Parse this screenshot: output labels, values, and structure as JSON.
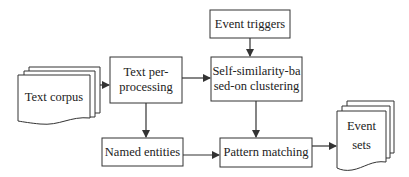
{
  "diagram": {
    "nodes": {
      "text_corpus": {
        "label": "Text corpus",
        "shape": "multi-document"
      },
      "text_preprocessing": {
        "line1": "Text per-",
        "line2": "processing",
        "shape": "rectangle"
      },
      "event_triggers": {
        "label": "Event triggers",
        "shape": "rectangle"
      },
      "self_similarity": {
        "line1": "Self-similarity-ba",
        "line2": "sed-on clustering",
        "shape": "rectangle"
      },
      "named_entities": {
        "label": "Named entities",
        "shape": "rectangle"
      },
      "pattern_matching": {
        "label": "Pattern matching",
        "shape": "rectangle"
      },
      "event_sets": {
        "line1": "Event",
        "line2": "sets",
        "shape": "multi-document"
      }
    },
    "edges": [
      {
        "from": "Text corpus",
        "to": "Text per-processing"
      },
      {
        "from": "Text per-processing",
        "to": "Self-similarity-based-on clustering"
      },
      {
        "from": "Event triggers",
        "to": "Self-similarity-based-on clustering"
      },
      {
        "from": "Text per-processing",
        "to": "Named entities"
      },
      {
        "from": "Self-similarity-based-on clustering",
        "to": "Pattern matching"
      },
      {
        "from": "Named entities",
        "to": "Pattern matching"
      },
      {
        "from": "Pattern matching",
        "to": "Event sets"
      }
    ],
    "colors": {
      "stroke": "#333333",
      "fill": "#ffffff",
      "text": "#222222"
    }
  }
}
